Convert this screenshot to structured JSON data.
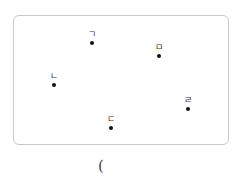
{
  "diagram": {
    "points": [
      {
        "label": "ㄱ",
        "x": 92,
        "y": 43,
        "label_dx": 0,
        "label_dy": -13
      },
      {
        "label": "ㅁ",
        "x": 159,
        "y": 56,
        "label_dx": 0,
        "label_dy": -13
      },
      {
        "label": "ㄴ",
        "x": 54,
        "y": 85,
        "label_dx": 0,
        "label_dy": -13
      },
      {
        "label": "ㄹ",
        "x": 188,
        "y": 109,
        "label_dx": 0,
        "label_dy": -13
      },
      {
        "label": "ㄷ",
        "x": 111,
        "y": 128,
        "label_dx": 0,
        "label_dy": -13
      }
    ],
    "answer_paren": "("
  }
}
